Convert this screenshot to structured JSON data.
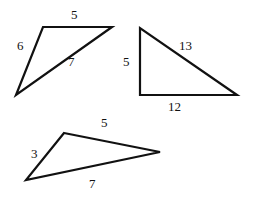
{
  "figure": {
    "stroke_color": "#111111",
    "background": "#ffffff",
    "triangles": [
      {
        "name": "triangle-a",
        "sides": [
          {
            "label": "5",
            "edge": "top"
          },
          {
            "label": "6",
            "edge": "left"
          },
          {
            "label": "7",
            "edge": "diagonal"
          }
        ]
      },
      {
        "name": "triangle-b",
        "right_angle": true,
        "sides": [
          {
            "label": "5",
            "edge": "left-vertical"
          },
          {
            "label": "13",
            "edge": "hypotenuse"
          },
          {
            "label": "12",
            "edge": "bottom"
          }
        ]
      },
      {
        "name": "triangle-c",
        "sides": [
          {
            "label": "5",
            "edge": "top"
          },
          {
            "label": "3",
            "edge": "left"
          },
          {
            "label": "7",
            "edge": "bottom"
          }
        ]
      }
    ]
  }
}
